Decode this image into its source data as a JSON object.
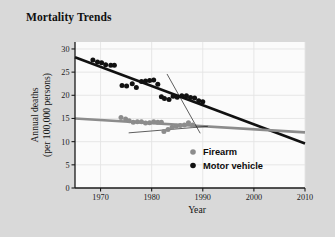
{
  "title": "Mortality Trends",
  "colors": {
    "card_background": "#d9d9d9",
    "plot_background": "#fbfbfb",
    "grid": "#e4e4e4",
    "axis": "#1a1a1a",
    "firearm": "#8c8c8c",
    "motor_vehicle": "#111111"
  },
  "legend": {
    "position": "inside-bottom-right",
    "entries": [
      {
        "label": "Firearm",
        "color": "#8c8c8c",
        "marker": "circle"
      },
      {
        "label": "Motor vehicle",
        "color": "#111111",
        "marker": "circle"
      }
    ]
  },
  "chart_data": {
    "type": "scatter",
    "title": "Mortality Trends",
    "xlabel": "Year",
    "ylabel": "Annual deaths (per 100,000 persons)",
    "ylabel_line1": "Annual deaths",
    "ylabel_line2": "(per 100,000 persons)",
    "xlim": [
      1965,
      2010
    ],
    "ylim": [
      0,
      31.5
    ],
    "xticks": [
      1970,
      1980,
      1990,
      2000,
      2010
    ],
    "xticklabels": [
      "1970",
      "1980",
      "1990",
      "2000",
      "2010"
    ],
    "yticks": [
      0,
      5,
      10,
      15,
      20,
      25,
      30
    ],
    "yticklabels": [
      "0",
      "5",
      "10",
      "15",
      "20",
      "25",
      "30"
    ],
    "grid": true,
    "series": [
      {
        "name": "Motor vehicle",
        "color": "#111111",
        "marker": "circle",
        "points": [
          {
            "x": 1968.5,
            "y": 27.6
          },
          {
            "x": 1969.4,
            "y": 27.2
          },
          {
            "x": 1970.2,
            "y": 27.0
          },
          {
            "x": 1971.0,
            "y": 26.6
          },
          {
            "x": 1972.0,
            "y": 26.5
          },
          {
            "x": 1972.7,
            "y": 26.5
          },
          {
            "x": 1974.2,
            "y": 22.1
          },
          {
            "x": 1975.1,
            "y": 22.0
          },
          {
            "x": 1976.2,
            "y": 22.5
          },
          {
            "x": 1977.0,
            "y": 21.7
          },
          {
            "x": 1978.0,
            "y": 23.0
          },
          {
            "x": 1978.8,
            "y": 23.1
          },
          {
            "x": 1979.6,
            "y": 23.2
          },
          {
            "x": 1980.4,
            "y": 23.3
          },
          {
            "x": 1981.2,
            "y": 22.4
          },
          {
            "x": 1981.9,
            "y": 19.7
          },
          {
            "x": 1982.5,
            "y": 19.3
          },
          {
            "x": 1983.4,
            "y": 19.1
          },
          {
            "x": 1984.2,
            "y": 19.8
          },
          {
            "x": 1985.0,
            "y": 19.6
          },
          {
            "x": 1985.9,
            "y": 19.9
          },
          {
            "x": 1986.8,
            "y": 19.9
          },
          {
            "x": 1987.6,
            "y": 19.5
          },
          {
            "x": 1988.4,
            "y": 19.4
          },
          {
            "x": 1989.2,
            "y": 18.8
          },
          {
            "x": 1990.0,
            "y": 18.6
          }
        ],
        "trendline": {
          "x1": 1965,
          "y1": 28.2,
          "x2": 2010,
          "y2": 9.6,
          "width": 2.6
        }
      },
      {
        "name": "Firearm",
        "color": "#8c8c8c",
        "marker": "circle",
        "points": [
          {
            "x": 1974.0,
            "y": 15.2
          },
          {
            "x": 1974.9,
            "y": 14.9
          },
          {
            "x": 1975.6,
            "y": 14.5
          },
          {
            "x": 1976.4,
            "y": 14.2
          },
          {
            "x": 1977.2,
            "y": 14.3
          },
          {
            "x": 1978.0,
            "y": 14.3
          },
          {
            "x": 1978.8,
            "y": 14.0
          },
          {
            "x": 1979.6,
            "y": 14.1
          },
          {
            "x": 1980.4,
            "y": 14.3
          },
          {
            "x": 1981.2,
            "y": 14.2
          },
          {
            "x": 1981.9,
            "y": 14.2
          },
          {
            "x": 1982.4,
            "y": 12.2
          },
          {
            "x": 1983.2,
            "y": 12.6
          },
          {
            "x": 1984.0,
            "y": 13.1
          },
          {
            "x": 1984.8,
            "y": 13.3
          },
          {
            "x": 1985.6,
            "y": 13.5
          },
          {
            "x": 1986.4,
            "y": 13.6
          },
          {
            "x": 1987.2,
            "y": 14.1
          },
          {
            "x": 1988.0,
            "y": 13.6
          }
        ],
        "trendline": {
          "x1": 1965,
          "y1": 15.0,
          "x2": 2010,
          "y2": 12.0,
          "width": 2.6
        }
      }
    ],
    "annotation_lines": [
      {
        "name": "motor-vehicle-segment-fit",
        "x1": 1983.0,
        "y1": 24.6,
        "x2": 1989.5,
        "y2": 11.8,
        "width": 0.7,
        "color": "#1a1a1a"
      },
      {
        "name": "firearm-segment-fit",
        "x1": 1975.5,
        "y1": 11.9,
        "x2": 1991.0,
        "y2": 13.3,
        "width": 0.7,
        "color": "#1a1a1a"
      }
    ]
  }
}
